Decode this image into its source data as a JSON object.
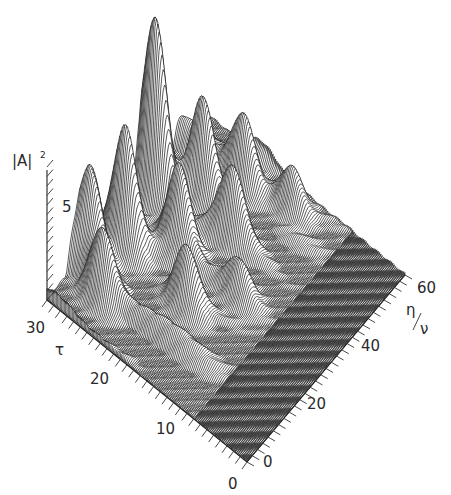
{
  "chart_data": {
    "type": "surface-waterfall",
    "title": "",
    "zlabel": "|A|²",
    "zlabel_main": "|A|",
    "zlabel_sup": "2",
    "xlabel": "τ",
    "ylabel": "η/ν",
    "ylabel_num": "η",
    "ylabel_den": "ν",
    "z_ticks": [
      {
        "value": 5,
        "label": "5"
      }
    ],
    "x_ticks": [
      {
        "value": 0,
        "label": "0"
      },
      {
        "value": 10,
        "label": "10"
      },
      {
        "value": 20,
        "label": "20"
      },
      {
        "value": 30,
        "label": "30"
      }
    ],
    "y_ticks": [
      {
        "value": 0,
        "label": "0"
      },
      {
        "value": 20,
        "label": "20"
      },
      {
        "value": 40,
        "label": "40"
      },
      {
        "value": 60,
        "label": "60"
      }
    ],
    "x_range": [
      0,
      30
    ],
    "y_range": [
      0,
      60
    ],
    "z_range": [
      0,
      7
    ],
    "grid": false,
    "legend": null,
    "peaks": [
      {
        "tau": 28,
        "eta": 36,
        "z": 9.5
      },
      {
        "tau": 27,
        "eta": 22,
        "z": 6.2
      },
      {
        "tau": 29,
        "eta": 14,
        "z": 5.0
      },
      {
        "tau": 24,
        "eta": 44,
        "z": 5.2
      },
      {
        "tau": 21,
        "eta": 52,
        "z": 3.4
      },
      {
        "tau": 22,
        "eta": 30,
        "z": 4.5
      },
      {
        "tau": 25,
        "eta": 8,
        "z": 3.6
      },
      {
        "tau": 18,
        "eta": 40,
        "z": 3.2
      },
      {
        "tau": 17,
        "eta": 20,
        "z": 3.0
      },
      {
        "tau": 15,
        "eta": 55,
        "z": 2.2
      },
      {
        "tau": 13,
        "eta": 30,
        "z": 1.8
      }
    ]
  }
}
